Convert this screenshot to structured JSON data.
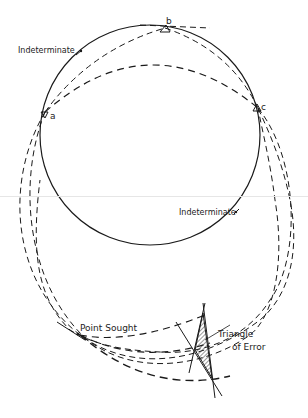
{
  "diagram": {
    "labels": {
      "indeterminate_top": "Indeterminate",
      "indeterminate_right": "Indeterminate",
      "point_b": "b",
      "point_a": "a",
      "point_c": "c",
      "point_sought": "Point Sought",
      "triangle_line1": "Triangle",
      "triangle_line2": "of Error"
    },
    "colors": {
      "stroke": "#1a1a1a",
      "hatch": "#333333",
      "background": "#ffffff"
    }
  }
}
